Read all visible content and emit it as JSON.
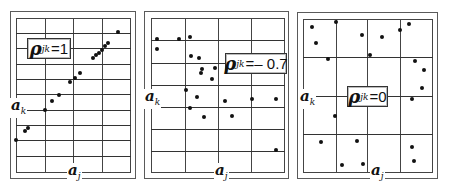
{
  "figure": {
    "panels": [
      {
        "id": "rho-1",
        "label": {
          "symbol": "ρ",
          "subscript": "jk",
          "equals": "=",
          "value": "1"
        },
        "x_axis_label": {
          "symbol": "a",
          "subscript": "j"
        },
        "y_axis_label": {
          "symbol": "a",
          "subscript": "k"
        }
      },
      {
        "id": "rho-neg-0.7",
        "label": {
          "symbol": "ρ",
          "subscript": "jk",
          "equals": "=",
          "value": "– 0.7"
        },
        "x_axis_label": {
          "symbol": "a",
          "subscript": "j"
        },
        "y_axis_label": {
          "symbol": "a",
          "subscript": "k"
        }
      },
      {
        "id": "rho-0",
        "label": {
          "symbol": "ρ",
          "subscript": "jk",
          "equals": "=",
          "value": "0"
        },
        "x_axis_label": {
          "symbol": "a",
          "subscript": "j"
        },
        "y_axis_label": {
          "symbol": "a",
          "subscript": "k"
        }
      }
    ]
  },
  "chart_data": [
    {
      "type": "scatter",
      "title": "ρjk = 1",
      "xlabel": "aj",
      "ylabel": "ak",
      "grid": true,
      "note": "points lie along a straight increasing line (perfect positive correlation); coordinates are pixel positions in panel",
      "points": [
        [
          16,
          140
        ],
        [
          25,
          131
        ],
        [
          28,
          128
        ],
        [
          45,
          110
        ],
        [
          52,
          101
        ],
        [
          59,
          95
        ],
        [
          70,
          82
        ],
        [
          75,
          78
        ],
        [
          80,
          73
        ],
        [
          93,
          58
        ],
        [
          96,
          55
        ],
        [
          99,
          53
        ],
        [
          102,
          50
        ],
        [
          105,
          46
        ],
        [
          108,
          43
        ],
        [
          118,
          32
        ]
      ]
    },
    {
      "type": "scatter",
      "title": "ρjk = -0.7",
      "xlabel": "aj",
      "ylabel": "ak",
      "grid": true,
      "note": "negative correlation scatter; pixel coordinates",
      "points": [
        [
          157,
          39
        ],
        [
          179,
          39
        ],
        [
          190,
          37
        ],
        [
          157,
          49
        ],
        [
          191,
          56
        ],
        [
          199,
          58
        ],
        [
          202,
          69
        ],
        [
          201,
          73
        ],
        [
          215,
          68
        ],
        [
          212,
          79
        ],
        [
          186,
          90
        ],
        [
          197,
          97
        ],
        [
          190,
          108
        ],
        [
          204,
          117
        ],
        [
          225,
          101
        ],
        [
          232,
          116
        ],
        [
          252,
          99
        ],
        [
          276,
          99
        ],
        [
          276,
          150
        ]
      ]
    },
    {
      "type": "scatter",
      "title": "ρjk = 0",
      "xlabel": "aj",
      "ylabel": "ak",
      "grid": true,
      "note": "uncorrelated scatter; pixel coordinates",
      "points": [
        [
          312,
          27
        ],
        [
          316,
          43
        ],
        [
          336,
          22
        ],
        [
          362,
          35
        ],
        [
          382,
          37
        ],
        [
          400,
          30
        ],
        [
          409,
          24
        ],
        [
          328,
          59
        ],
        [
          370,
          55
        ],
        [
          415,
          61
        ],
        [
          424,
          70
        ],
        [
          422,
          88
        ],
        [
          412,
          99
        ],
        [
          335,
          116
        ],
        [
          321,
          142
        ],
        [
          357,
          141
        ],
        [
          342,
          165
        ],
        [
          363,
          164
        ],
        [
          412,
          147
        ],
        [
          414,
          161
        ]
      ]
    }
  ]
}
